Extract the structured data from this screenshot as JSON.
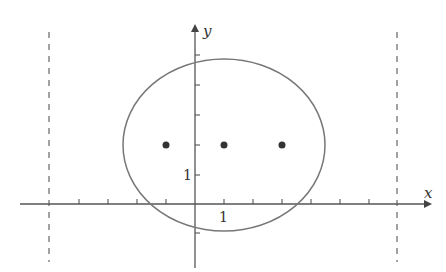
{
  "diagram": {
    "axes": {
      "x_label": "x",
      "y_label": "y",
      "x_tick_label": "1",
      "y_tick_label": "1"
    },
    "ellipse": {
      "center": [
        1,
        2
      ],
      "rx_units": 3.5,
      "ry_units": 2.9
    },
    "points": [
      {
        "x": -1,
        "y": 2
      },
      {
        "x": 1,
        "y": 2
      },
      {
        "x": 3,
        "y": 2
      }
    ],
    "dashed_lines_x": [
      -5,
      7
    ],
    "colors": {
      "stroke": "#555555",
      "ellipse": "#777777",
      "point": "#333333"
    }
  }
}
